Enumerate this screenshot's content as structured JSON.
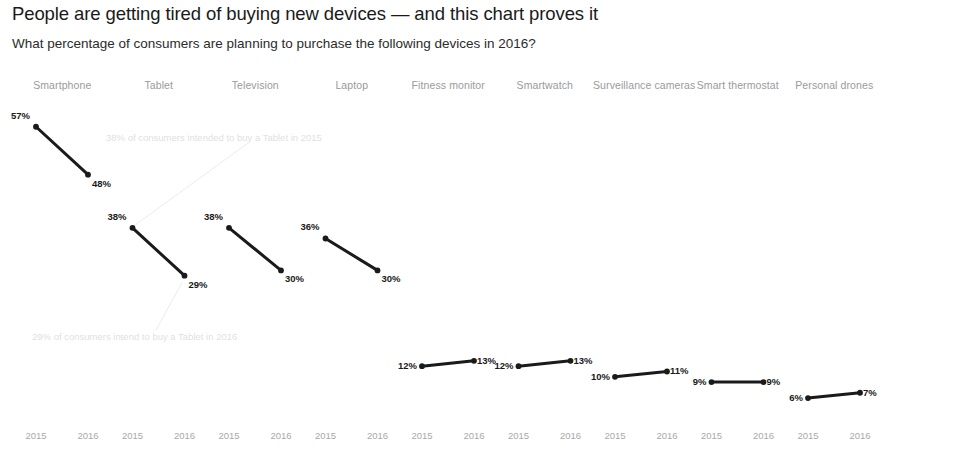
{
  "header": {
    "title": "People are getting tired of buying new devices — and this chart proves it",
    "subtitle": "What percentage of consumers are planning to purchase the following devices in 2016?"
  },
  "annotations": {
    "top": "38% of consumers intended to buy a Tablet in 2015",
    "bottom": "29% of consumers intend to buy a Tablet in 2016"
  },
  "axis": {
    "year_2015": "2015",
    "year_2016": "2016"
  },
  "chart_data": {
    "type": "line",
    "title": "People are getting tired of buying new devices — and this chart proves it",
    "subtitle": "What percentage of consumers are planning to purchase the following devices in 2016?",
    "xlabel": "",
    "ylabel": "",
    "x": [
      "2015",
      "2016"
    ],
    "ylim": [
      0,
      60
    ],
    "grid": false,
    "legend": "none",
    "layout": "small-multiples, 9 panels side by side, shared y-scale",
    "panels": [
      {
        "label": "Smartphone",
        "values": [
          57,
          48
        ],
        "labels": [
          "57%",
          "48%"
        ]
      },
      {
        "label": "Tablet",
        "values": [
          38,
          29
        ],
        "labels": [
          "38%",
          "29%"
        ]
      },
      {
        "label": "Television",
        "values": [
          38,
          30
        ],
        "labels": [
          "38%",
          "30%"
        ]
      },
      {
        "label": "Laptop",
        "values": [
          36,
          30
        ],
        "labels": [
          "36%",
          "30%"
        ]
      },
      {
        "label": "Fitness monitor",
        "values": [
          12,
          13
        ],
        "labels": [
          "12%",
          "13%"
        ]
      },
      {
        "label": "Smartwatch",
        "values": [
          12,
          13
        ],
        "labels": [
          "12%",
          "13%"
        ]
      },
      {
        "label": "Surveillance cameras",
        "values": [
          10,
          11
        ],
        "labels": [
          "10%",
          "11%"
        ]
      },
      {
        "label": "Smart thermostat",
        "values": [
          9,
          9
        ],
        "labels": [
          "9%",
          "9%"
        ]
      },
      {
        "label": "Personal drones",
        "values": [
          6,
          7
        ],
        "labels": [
          "6%",
          "7%"
        ]
      }
    ],
    "annotations": [
      "38% of consumers intended to buy a Tablet in 2015",
      "29% of consumers intend to buy a Tablet in 2016"
    ],
    "colors": {
      "line": "#1a1a1a",
      "marker": "#1a1a1a",
      "panel_header": "#9a9a9a",
      "axis_label": "#a8a8a8",
      "annotation": "#dfdfdf",
      "background": "#ffffff"
    }
  }
}
